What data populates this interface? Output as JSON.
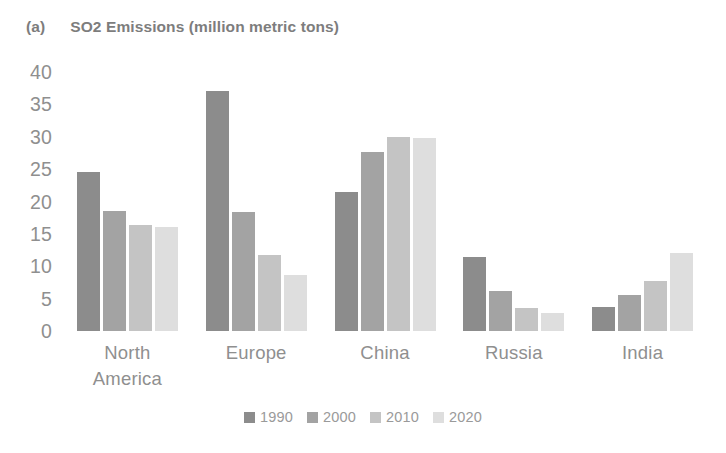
{
  "panel": {
    "label": "(a)"
  },
  "legend": {
    "position": "bottom-center",
    "entries": [
      {
        "label": "1990",
        "color": "#8c8c8c"
      },
      {
        "label": "2000",
        "color": "#a3a3a3"
      },
      {
        "label": "2010",
        "color": "#c4c4c4"
      },
      {
        "label": "2020",
        "color": "#dedede"
      }
    ]
  },
  "axis": {
    "yticks": [
      "40",
      "35",
      "30",
      "25",
      "20",
      "15",
      "10",
      "5",
      "0"
    ]
  },
  "chart_data": {
    "type": "bar",
    "title": "SO2 Emissions (million metric tons)",
    "subtitle": "",
    "xlabel": "",
    "ylabel": "",
    "ylim": [
      0,
      40
    ],
    "ytick_step": 5,
    "grid": false,
    "legend_position": "bottom-center",
    "categories": [
      "North\nAmerica",
      "Europe",
      "China",
      "Russia",
      "India"
    ],
    "series": [
      {
        "name": "1990",
        "color": "#8c8c8c",
        "values": [
          24.5,
          37.0,
          21.5,
          11.5,
          3.7
        ]
      },
      {
        "name": "2000",
        "color": "#a3a3a3",
        "values": [
          18.5,
          18.4,
          27.7,
          6.2,
          5.6
        ]
      },
      {
        "name": "2010",
        "color": "#c4c4c4",
        "values": [
          16.3,
          11.8,
          30.0,
          3.5,
          7.8
        ]
      },
      {
        "name": "2020",
        "color": "#dedede",
        "values": [
          16.0,
          8.7,
          29.8,
          2.8,
          12.0
        ]
      }
    ]
  }
}
